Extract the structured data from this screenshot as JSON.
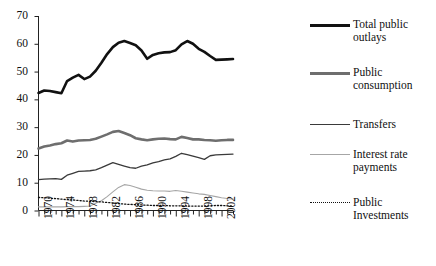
{
  "chart_data": {
    "type": "line",
    "title": "",
    "xlabel": "",
    "ylabel": "",
    "xlim": [
      1970,
      2004
    ],
    "ylim": [
      0,
      70
    ],
    "yticks": [
      0,
      10,
      20,
      30,
      40,
      50,
      60,
      70
    ],
    "xticks_labeled": [
      1970,
      1974,
      1978,
      1982,
      1986,
      1990,
      1994,
      1998,
      2002
    ],
    "x": [
      1970,
      1971,
      1972,
      1973,
      1974,
      1975,
      1976,
      1977,
      1978,
      1979,
      1980,
      1981,
      1982,
      1983,
      1984,
      1985,
      1986,
      1987,
      1988,
      1989,
      1990,
      1991,
      1992,
      1993,
      1994,
      1995,
      1996,
      1997,
      1998,
      1999,
      2000,
      2001,
      2002,
      2003,
      2004
    ],
    "grid": false,
    "legend_position": "right",
    "series": [
      {
        "name": "Total public outlays",
        "color": "#111111",
        "width": 2.6,
        "dash": "none",
        "values": [
          42.3,
          43.2,
          43.0,
          42.6,
          42.2,
          46.6,
          47.8,
          48.8,
          47.3,
          48.2,
          50.3,
          53.2,
          56.3,
          58.8,
          60.4,
          61.0,
          60.3,
          59.5,
          57.6,
          54.6,
          56.0,
          56.6,
          56.9,
          57.0,
          57.7,
          59.8,
          61.0,
          60.0,
          58.2,
          57.1,
          55.6,
          54.2,
          54.3,
          54.4,
          54.5
        ]
      },
      {
        "name": "Public consumption",
        "color": "#6e6e6e",
        "width": 2.6,
        "dash": "none",
        "values": [
          22.3,
          23.0,
          23.4,
          23.9,
          24.2,
          25.2,
          24.8,
          25.2,
          25.3,
          25.4,
          25.8,
          26.6,
          27.4,
          28.3,
          28.6,
          27.9,
          27.1,
          26.0,
          25.6,
          25.3,
          25.6,
          25.8,
          25.9,
          25.7,
          25.6,
          26.5,
          26.1,
          25.6,
          25.6,
          25.4,
          25.3,
          25.1,
          25.3,
          25.4,
          25.4
        ]
      },
      {
        "name": "Transfers",
        "color": "#3a3a3a",
        "width": 1.3,
        "dash": "none",
        "values": [
          11.1,
          11.3,
          11.4,
          11.5,
          11.2,
          12.7,
          13.4,
          14.1,
          14.2,
          14.3,
          14.6,
          15.4,
          16.3,
          17.2,
          16.6,
          16.0,
          15.4,
          15.2,
          16.0,
          16.4,
          17.1,
          17.6,
          18.2,
          18.6,
          19.5,
          20.6,
          20.1,
          19.6,
          19.0,
          18.4,
          19.7,
          20.0,
          20.1,
          20.2,
          20.3
        ]
      },
      {
        "name": "Interest rate payments",
        "color": "#a6a6a6",
        "width": 1.1,
        "dash": "none",
        "values": [
          1.3,
          1.3,
          1.3,
          1.3,
          1.3,
          1.4,
          1.4,
          1.4,
          1.5,
          1.6,
          2.6,
          3.5,
          5.0,
          6.7,
          8.3,
          9.3,
          9.0,
          8.4,
          7.7,
          7.3,
          7.1,
          7.0,
          7.0,
          6.9,
          7.2,
          6.9,
          6.6,
          6.3,
          6.0,
          5.8,
          5.4,
          5.0,
          4.6,
          4.3,
          4.1
        ]
      },
      {
        "name": "Public Investments",
        "color": "#111111",
        "width": 1.3,
        "dash": "1.2 2.0",
        "values": [
          4.7,
          4.6,
          4.4,
          4.3,
          4.1,
          3.9,
          3.8,
          3.6,
          3.4,
          3.3,
          3.2,
          3.1,
          2.9,
          2.7,
          2.5,
          2.3,
          2.2,
          2.1,
          2.0,
          1.9,
          1.8,
          1.8,
          1.8,
          1.7,
          1.7,
          1.7,
          1.6,
          1.6,
          1.6,
          1.6,
          1.7,
          1.8,
          1.8,
          1.7,
          1.6
        ]
      }
    ]
  },
  "axes": {
    "ytick_labels": [
      "70",
      "60",
      "50",
      "40",
      "30",
      "20",
      "10",
      "0"
    ],
    "xtick_labels": [
      "1970",
      "1974",
      "1978",
      "1982",
      "1986",
      "1990",
      "1994",
      "1998",
      "2002"
    ]
  },
  "legend": {
    "items": [
      {
        "label": "Total public\noutlays",
        "color": "#111111",
        "thickness": "2.6px",
        "style": "solid"
      },
      {
        "label": "Public\nconsumption",
        "color": "#6e6e6e",
        "thickness": "2.6px",
        "style": "solid"
      },
      {
        "label": "Transfers",
        "color": "#3a3a3a",
        "thickness": "1.4px",
        "style": "solid"
      },
      {
        "label": "Interest rate\npayments",
        "color": "#a6a6a6",
        "thickness": "1.2px",
        "style": "solid"
      },
      {
        "label": "Public\nInvestments",
        "color": "#111111",
        "thickness": "1.4px",
        "style": "dotted"
      }
    ]
  }
}
